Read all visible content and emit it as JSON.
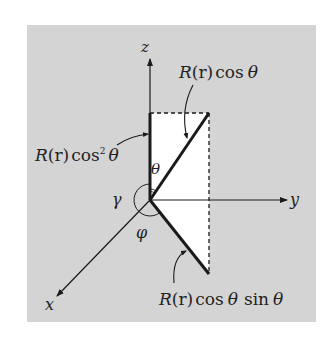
{
  "figure": {
    "axes": {
      "x_label": "x",
      "y_label": "y",
      "z_label": "z"
    },
    "angles": {
      "theta": "θ",
      "gamma": "γ",
      "phi": "φ"
    },
    "annotations": {
      "projection_z": {
        "R": "R",
        "r": "(r)",
        "fn": "cos",
        "sup": "2",
        "arg": "θ"
      },
      "hypotenuse": {
        "R": "R",
        "r": "(r)",
        "fn": "cos",
        "arg": "θ"
      },
      "lower_segment": {
        "R": "R",
        "r": "(r)",
        "fn1": "cos",
        "arg1": "θ",
        "fn2": "sin",
        "arg2": "θ"
      }
    },
    "colors": {
      "background": "#d4d4d4",
      "triangle_fill": "#ffffff",
      "stroke": "#1a1a1a"
    }
  }
}
